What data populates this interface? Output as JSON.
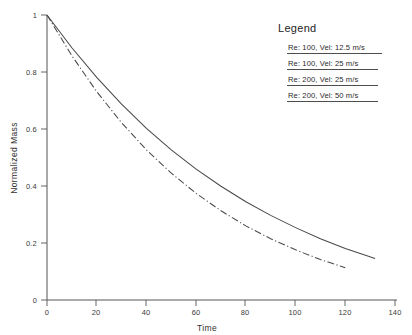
{
  "chart_data": {
    "type": "line",
    "title": "",
    "xlabel": "Time",
    "ylabel": "Normalized Mass",
    "xlim": [
      0,
      140
    ],
    "ylim": [
      0,
      1
    ],
    "xticks": [
      "0",
      "20",
      "40",
      "60",
      "80",
      "100",
      "120",
      "140"
    ],
    "xtick_values": [
      0,
      20,
      40,
      60,
      80,
      100,
      120,
      140
    ],
    "yticks": [
      "0",
      "0.2",
      "0.4",
      "0.6",
      "0.8",
      "1"
    ],
    "ytick_values": [
      0,
      0.2,
      0.4,
      0.6,
      0.8,
      1
    ],
    "grid": false,
    "legend_position": "top-right",
    "series": [
      {
        "name": "Re: 100, Vel: 12.5 m/s",
        "style": "solid",
        "x": [
          0,
          10,
          20,
          30,
          40,
          50,
          60,
          70,
          80,
          90,
          100,
          110,
          120,
          132
        ],
        "y": [
          1.0,
          0.885,
          0.781,
          0.687,
          0.602,
          0.527,
          0.459,
          0.399,
          0.345,
          0.297,
          0.254,
          0.215,
          0.181,
          0.146
        ]
      },
      {
        "name": "Re: 100, Vel: 25 m/s",
        "style": "solid",
        "x": [
          0,
          10,
          20,
          30,
          40,
          50,
          60,
          70,
          80,
          90,
          100,
          110,
          120,
          132
        ],
        "y": [
          1.0,
          0.885,
          0.781,
          0.687,
          0.602,
          0.527,
          0.459,
          0.399,
          0.345,
          0.297,
          0.254,
          0.215,
          0.181,
          0.146
        ]
      },
      {
        "name": "Re: 200, Vel: 25 m/s",
        "style": "dash-dot",
        "x": [
          0,
          10,
          20,
          30,
          40,
          50,
          60,
          70,
          80,
          90,
          100,
          110,
          120
        ],
        "y": [
          1.0,
          0.857,
          0.731,
          0.622,
          0.527,
          0.445,
          0.374,
          0.313,
          0.26,
          0.215,
          0.176,
          0.142,
          0.113
        ]
      },
      {
        "name": "Re: 200, Vel: 50 m/s",
        "style": "dash-dot",
        "x": [
          0,
          10,
          20,
          30,
          40,
          50,
          60,
          70,
          80,
          90,
          100,
          110,
          120
        ],
        "y": [
          1.0,
          0.857,
          0.731,
          0.622,
          0.527,
          0.445,
          0.374,
          0.313,
          0.26,
          0.215,
          0.176,
          0.142,
          0.113
        ]
      }
    ]
  },
  "legend": {
    "title": "Legend",
    "entries": [
      {
        "label": "Re: 100, Vel: 12.5 m/s"
      },
      {
        "label": "Re: 100, Vel: 25 m/s"
      },
      {
        "label": "Re: 200, Vel: 25 m/s"
      },
      {
        "label": "Re: 200, Vel: 50 m/s"
      }
    ]
  },
  "colors": {
    "curve": "#4a4a4a",
    "axis": "#555555",
    "text": "#2b2b2b",
    "background": "#ffffff"
  }
}
